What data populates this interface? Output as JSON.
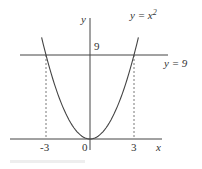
{
  "figure": {
    "curve_label": "y = x",
    "curve_exponent": "2",
    "line_label": "y = 9",
    "y_axis_label": "y",
    "x_axis_label": "x",
    "y_tick_label": "9",
    "x_tick_labels": [
      "-3",
      "0",
      "3"
    ],
    "colors": {
      "ink": "#333333",
      "background": "#ffffff"
    }
  },
  "chart_data": {
    "type": "line",
    "title": "",
    "xlabel": "x",
    "ylabel": "y",
    "series": [
      {
        "name": "y = x^2",
        "function": "x^2",
        "x": [
          -3.3,
          -3,
          -2,
          -1,
          0,
          1,
          2,
          3,
          3.3
        ],
        "values": [
          10.9,
          9,
          4,
          1,
          0,
          1,
          4,
          9,
          10.9
        ]
      },
      {
        "name": "y = 9",
        "function": "9",
        "x": [
          -4.7,
          5.4
        ],
        "values": [
          9,
          9
        ]
      }
    ],
    "annotations": [
      {
        "type": "dashed-vertical",
        "x": -3,
        "from_y": 0,
        "to_y": 9
      },
      {
        "type": "dashed-vertical",
        "x": 3,
        "from_y": 0,
        "to_y": 9
      }
    ],
    "x_ticks": [
      -3,
      0,
      3
    ],
    "y_ticks": [
      9
    ],
    "grid": false,
    "legend": "none"
  }
}
